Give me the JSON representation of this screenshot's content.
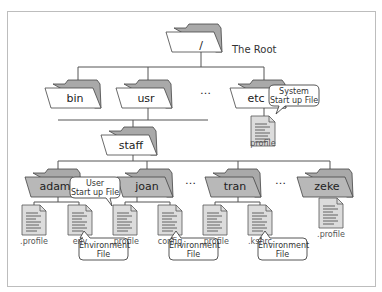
{
  "root": {
    "name": "/",
    "caption": "The Root"
  },
  "level1": [
    {
      "name": "bin"
    },
    {
      "name": "usr"
    },
    {
      "name": "etc"
    }
  ],
  "etc_file": {
    "name": "profile",
    "callout": "System\nStart up File"
  },
  "staff": {
    "name": "staff"
  },
  "users": [
    {
      "name": "adam",
      "files": [
        ".profile",
        "env"
      ]
    },
    {
      "name": "joan",
      "files": [
        ".profile",
        "config"
      ]
    },
    {
      "name": "tran",
      "files": [
        ".profile",
        ".kshrc"
      ]
    },
    {
      "name": "zeke",
      "files": [
        ".profile"
      ]
    }
  ],
  "callouts": {
    "user_startup": "User\nStart up File",
    "env_file_1": "Environment\nFile",
    "env_file_2": "Environment\nFile",
    "env_file_3": "Environment\nFile"
  },
  "ellipsis": "…",
  "colors": {
    "folder_fill": "#ffffff",
    "folder_back": "#a9a9a9",
    "user_folder_fill": "#b3b3b3",
    "line": "#555555",
    "file_fill": "#d9d9d9",
    "frame": "#bdbdbd"
  }
}
